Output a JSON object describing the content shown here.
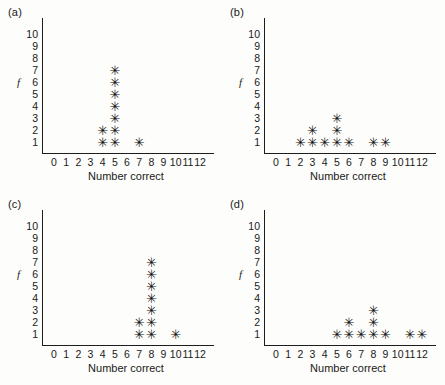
{
  "figure": {
    "marker_glyph": "✳",
    "axis_color": "#1d1d1d",
    "background_color": "#fdfdfb"
  },
  "panels": [
    {
      "label": "(a)",
      "chart_data": {
        "type": "scatter",
        "title": "(a)",
        "xlabel": "Number correct",
        "ylabel": "f",
        "xticks": [
          "0",
          "1",
          "2",
          "3",
          "4",
          "5",
          "6",
          "7",
          "8",
          "9",
          "10",
          "11",
          "12"
        ],
        "yticks": [
          "1",
          "2",
          "3",
          "4",
          "5",
          "6",
          "7",
          "8",
          "9",
          "10"
        ],
        "xlim": [
          0,
          12
        ],
        "ylim": [
          0,
          10
        ],
        "grid": false,
        "legend": null,
        "categories": [
          0,
          1,
          2,
          3,
          4,
          5,
          6,
          7,
          8,
          9,
          10,
          11,
          12
        ],
        "values": [
          0,
          0,
          0,
          0,
          2,
          7,
          0,
          1,
          0,
          0,
          0,
          0,
          0
        ]
      }
    },
    {
      "label": "(b)",
      "chart_data": {
        "type": "scatter",
        "title": "(b)",
        "xlabel": "Number correct",
        "ylabel": "f",
        "xticks": [
          "0",
          "1",
          "2",
          "3",
          "4",
          "5",
          "6",
          "7",
          "8",
          "9",
          "10",
          "11",
          "12"
        ],
        "yticks": [
          "1",
          "2",
          "3",
          "4",
          "5",
          "6",
          "7",
          "8",
          "9",
          "10"
        ],
        "xlim": [
          0,
          12
        ],
        "ylim": [
          0,
          10
        ],
        "grid": false,
        "legend": null,
        "categories": [
          0,
          1,
          2,
          3,
          4,
          5,
          6,
          7,
          8,
          9,
          10,
          11,
          12
        ],
        "values": [
          0,
          0,
          1,
          2,
          1,
          3,
          1,
          0,
          1,
          1,
          0,
          0,
          0
        ]
      }
    },
    {
      "label": "(c)",
      "chart_data": {
        "type": "scatter",
        "title": "(c)",
        "xlabel": "Number correct",
        "ylabel": "f",
        "xticks": [
          "0",
          "1",
          "2",
          "3",
          "4",
          "5",
          "6",
          "7",
          "8",
          "9",
          "10",
          "11",
          "12"
        ],
        "yticks": [
          "1",
          "2",
          "3",
          "4",
          "5",
          "6",
          "7",
          "8",
          "9",
          "10"
        ],
        "xlim": [
          0,
          12
        ],
        "ylim": [
          0,
          10
        ],
        "grid": false,
        "legend": null,
        "categories": [
          0,
          1,
          2,
          3,
          4,
          5,
          6,
          7,
          8,
          9,
          10,
          11,
          12
        ],
        "values": [
          0,
          0,
          0,
          0,
          0,
          0,
          0,
          2,
          7,
          0,
          1,
          0,
          0
        ]
      }
    },
    {
      "label": "(d)",
      "chart_data": {
        "type": "scatter",
        "title": "(d)",
        "xlabel": "Number correct",
        "ylabel": "f",
        "xticks": [
          "0",
          "1",
          "2",
          "3",
          "4",
          "5",
          "6",
          "7",
          "8",
          "9",
          "10",
          "11",
          "12"
        ],
        "yticks": [
          "1",
          "2",
          "3",
          "4",
          "5",
          "6",
          "7",
          "8",
          "9",
          "10"
        ],
        "xlim": [
          0,
          12
        ],
        "ylim": [
          0,
          10
        ],
        "grid": false,
        "legend": null,
        "categories": [
          0,
          1,
          2,
          3,
          4,
          5,
          6,
          7,
          8,
          9,
          10,
          11,
          12
        ],
        "values": [
          0,
          0,
          0,
          0,
          0,
          1,
          2,
          1,
          3,
          1,
          0,
          1,
          1
        ]
      }
    }
  ]
}
